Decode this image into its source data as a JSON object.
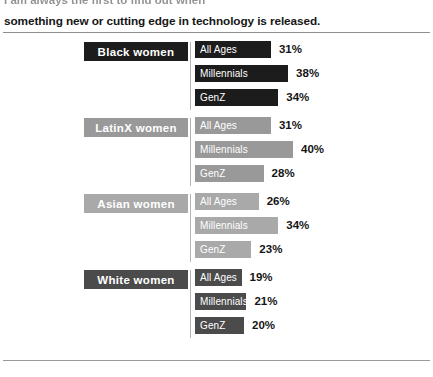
{
  "page": {
    "clipped_caption": "I am always the first to find out when",
    "caption": "something new or cutting edge in technology is released."
  },
  "chart_data": {
    "type": "bar",
    "title": "",
    "xlabel": "",
    "ylabel": "",
    "orientation": "horizontal",
    "value_suffix": "%",
    "xlim": [
      0,
      100
    ],
    "grid": false,
    "legend": "none",
    "categories": [
      "All Ages",
      "Millennials",
      "GenZ"
    ],
    "groups": [
      {
        "name": "Black women",
        "color": "#1c1c1c",
        "bar_color": "#1c1c1c",
        "label_text_color": "#ffffff",
        "values": [
          31,
          38,
          34
        ],
        "value_labels": [
          "31%",
          "38%",
          "34%"
        ]
      },
      {
        "name": "LatinX women",
        "color": "#999999",
        "bar_color": "#999999",
        "label_text_color": "#ffffff",
        "values": [
          31,
          40,
          28
        ],
        "value_labels": [
          "31%",
          "40%",
          "28%"
        ]
      },
      {
        "name": "Asian women",
        "color": "#a9a9a9",
        "bar_color": "#a9a9a9",
        "label_text_color": "#ffffff",
        "values": [
          26,
          34,
          23
        ],
        "value_labels": [
          "26%",
          "34%",
          "23%"
        ]
      },
      {
        "name": "White women",
        "color": "#4b4b4b",
        "bar_color": "#4b4b4b",
        "label_text_color": "#ffffff",
        "values": [
          19,
          21,
          20
        ],
        "value_labels": [
          "19%",
          "21%",
          "20%"
        ]
      }
    ]
  },
  "style": {
    "background": "#ffffff",
    "rule_color": "#8f8f8f",
    "value_text_color": "#151515",
    "px_per_percent": 2.45
  }
}
